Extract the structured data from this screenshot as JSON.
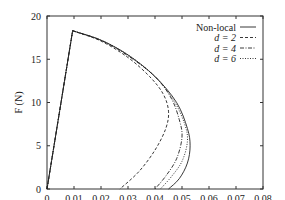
{
  "chart_data": {
    "type": "line",
    "title": "",
    "xlabel": "u (mm)",
    "ylabel": "F (N)",
    "xlim": [
      0,
      0.08
    ],
    "ylim": [
      0,
      20
    ],
    "xticks": [
      "0",
      "0.01",
      "0.02",
      "0.03",
      "0.04",
      "0.05",
      "0.06",
      "0.07",
      "0.08"
    ],
    "yticks": [
      "0",
      "5",
      "10",
      "15",
      "20"
    ],
    "grid": false,
    "legend_position": "top-right",
    "series": [
      {
        "name": "Non-local",
        "style": "solid",
        "x": [
          0,
          0.0095,
          0.02,
          0.03,
          0.04,
          0.048,
          0.052,
          0.053,
          0.052,
          0.049,
          0.045
        ],
        "y": [
          0,
          18.3,
          17.2,
          15.5,
          13.0,
          10.0,
          7.0,
          5.0,
          3.0,
          1.2,
          0
        ]
      },
      {
        "name": "d = 2",
        "style": "dashed",
        "x": [
          0,
          0.0095,
          0.02,
          0.03,
          0.038,
          0.043,
          0.045,
          0.044,
          0.04,
          0.034,
          0.027
        ],
        "y": [
          0,
          18.3,
          17.1,
          15.2,
          13.0,
          11.0,
          9.0,
          7.0,
          4.5,
          2.0,
          0
        ]
      },
      {
        "name": "d = 4",
        "style": "dash-dot",
        "x": [
          0,
          0.0095,
          0.02,
          0.03,
          0.04,
          0.046,
          0.049,
          0.05,
          0.048,
          0.044,
          0.04
        ],
        "y": [
          0,
          18.3,
          17.2,
          15.4,
          13.0,
          10.5,
          8.0,
          6.0,
          3.5,
          1.5,
          0
        ]
      },
      {
        "name": "d = 6",
        "style": "dotted",
        "x": [
          0,
          0.0095,
          0.02,
          0.03,
          0.04,
          0.047,
          0.051,
          0.052,
          0.05,
          0.046,
          0.042
        ],
        "y": [
          0,
          18.3,
          17.2,
          15.5,
          13.0,
          10.2,
          7.5,
          5.5,
          3.2,
          1.4,
          0
        ]
      }
    ]
  },
  "legend": {
    "items": [
      {
        "label": "Non-local"
      },
      {
        "label": "d = 2"
      },
      {
        "label": "d = 4"
      },
      {
        "label": "d = 6"
      }
    ]
  },
  "axes": {
    "xlabel": "u (mm)",
    "ylabel": "F (N)"
  }
}
